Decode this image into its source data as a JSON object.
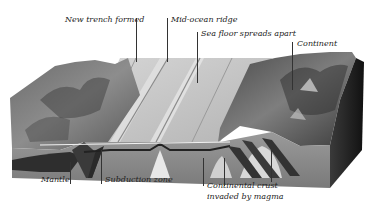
{
  "diagram": {
    "labels": {
      "new_trench": "New trench formed",
      "mid_ocean_ridge": "Mid-ocean ridge",
      "sea_floor_spreads": "Sea floor spreads apart",
      "continent": "Continent",
      "mantle": "Mantle",
      "subduction_zone": "Subduction zone",
      "continental_crust_line1": "Continental crust",
      "continental_crust_line2": "invaded by magma"
    },
    "colors": {
      "background": "#ffffff",
      "sea_floor": "#c9c9c9",
      "mountains_dark": "#3a3a3a",
      "mountains_mid": "#7a7a7a",
      "crust_side": "#8c8c8c",
      "mantle_dark": "#2e2e2e",
      "magma_light": "#d8d8d8",
      "block_shadow": "#1a1a1a",
      "label_text": "#222222"
    }
  }
}
